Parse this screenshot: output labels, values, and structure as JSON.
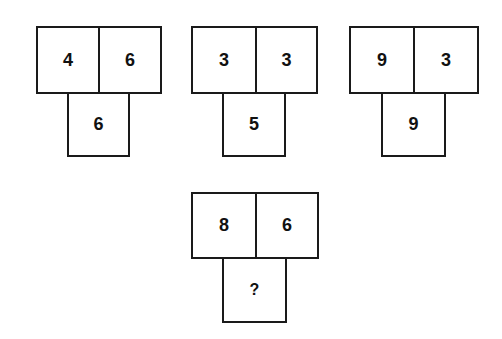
{
  "puzzle": {
    "figures": [
      {
        "left": "4",
        "right": "6",
        "bottom": "6"
      },
      {
        "left": "3",
        "right": "3",
        "bottom": "5"
      },
      {
        "left": "9",
        "right": "3",
        "bottom": "9"
      },
      {
        "left": "8",
        "right": "6",
        "bottom": "?"
      }
    ]
  }
}
